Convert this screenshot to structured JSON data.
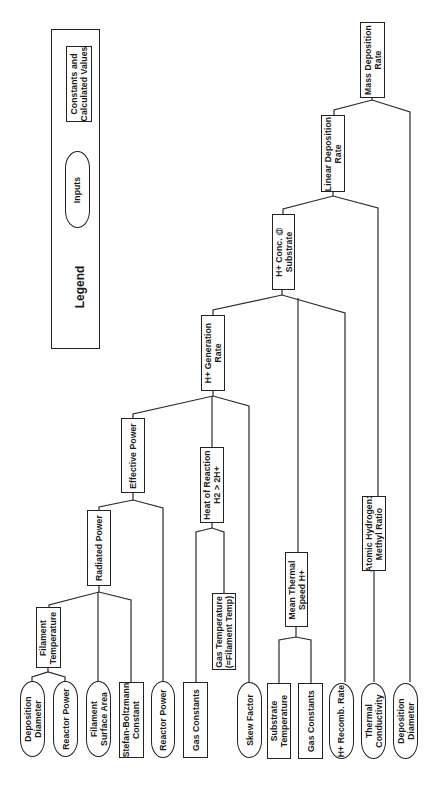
{
  "legend": {
    "title": "Legend",
    "inputs_label": "Inputs",
    "constants_label": "Constants and\nCalculated Values"
  },
  "nodes": {
    "mass_deposition_rate": "Mass Deposition\nRate",
    "linear_deposition_rate": "Linear Deposition\nRate",
    "h_conc_substrate": "H+ Conc. @\nSubstrate",
    "h_generation_rate": "H+ Generation\nRate",
    "effective_power": "Effective Power",
    "heat_of_reaction": "Heat of Reaction\nH2 > 2H+",
    "radiated_power": "Radiated Power",
    "mean_thermal_speed": "Mean Thermal\nSpeed H+",
    "atomic_hydrogen_methyl_ratio": "Atomic Hydrogen:\nMethyl Ratio",
    "filament_temperature": "Filament\nTemperature",
    "gas_temperature": "Gas Temperature\n(=Filament Temp)"
  },
  "leaves": [
    {
      "label": "Deposition\nDiameter",
      "kind": "input"
    },
    {
      "label": "Reactor Power",
      "kind": "input"
    },
    {
      "label": "Filament\nSurface Area",
      "kind": "input"
    },
    {
      "label": "Stefan-Boltzmann\nConstant",
      "kind": "constant"
    },
    {
      "label": "Reactor Power",
      "kind": "input"
    },
    {
      "label": "Gas Constants",
      "kind": "constant"
    },
    {
      "label": "Skew Factor",
      "kind": "input"
    },
    {
      "label": "Substrate\nTemperature",
      "kind": "constant"
    },
    {
      "label": "Gas Constants",
      "kind": "constant"
    },
    {
      "label": "H+ Recomb. Rate",
      "kind": "input"
    },
    {
      "label": "Thermal\nConductivity",
      "kind": "input"
    },
    {
      "label": "Deposition\nDiameter",
      "kind": "input"
    }
  ]
}
